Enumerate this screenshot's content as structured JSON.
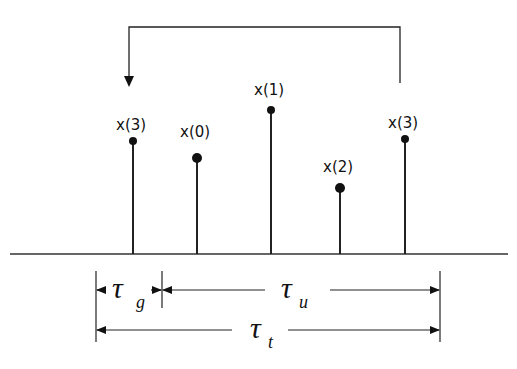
{
  "diagram": {
    "type": "cyclic-prefix-ofdm-symbol",
    "baseline": {
      "y": 254,
      "x1": 10,
      "x2": 508
    },
    "samples": [
      {
        "label": "x(3)",
        "x": 133,
        "top": 141,
        "role": "cyclic-prefix"
      },
      {
        "label": "x(0)",
        "x": 197,
        "top": 158
      },
      {
        "label": "x(1)",
        "x": 271,
        "top": 110
      },
      {
        "label": "x(2)",
        "x": 340,
        "top": 188
      },
      {
        "label": "x(3)",
        "x": 405,
        "top": 139
      }
    ],
    "copy_arrow": {
      "from_x": 400,
      "to_x": 129,
      "top_y": 27,
      "from_bottom_y": 83,
      "to_bottom_y": 85
    },
    "intervals": {
      "tau_g": {
        "symbol": "τ",
        "sub": "g",
        "x1": 96,
        "x2": 162,
        "y": 290
      },
      "tau_u": {
        "symbol": "τ",
        "sub": "u",
        "x1": 162,
        "x2": 440,
        "y": 290
      },
      "tau_t": {
        "symbol": "τ",
        "sub": "t",
        "x1": 96,
        "x2": 440,
        "y": 330
      }
    }
  },
  "labels": {
    "s0": "x(3)",
    "s1": "x(0)",
    "s2": "x(1)",
    "s3": "x(2)",
    "s4": "x(3)",
    "tau": "τ",
    "g": "g",
    "u": "u",
    "t": "t"
  }
}
